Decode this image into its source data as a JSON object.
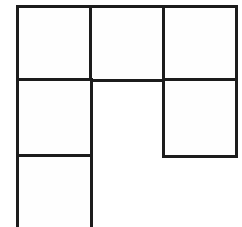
{
  "diagram": {
    "type": "grid-shape",
    "line_color": "#1c1c1c",
    "background_color": "#ffffff",
    "cells": [
      {
        "id": "r1c1",
        "row": 1,
        "col": 1,
        "label": ""
      },
      {
        "id": "r1c2",
        "row": 1,
        "col": 2,
        "label": ""
      },
      {
        "id": "r1c3",
        "row": 1,
        "col": 3,
        "label": ""
      },
      {
        "id": "r2c1",
        "row": 2,
        "col": 1,
        "label": ""
      },
      {
        "id": "r2c3",
        "row": 2,
        "col": 3,
        "label": ""
      },
      {
        "id": "r3c1",
        "row": 3,
        "col": 1,
        "label": ""
      }
    ]
  }
}
